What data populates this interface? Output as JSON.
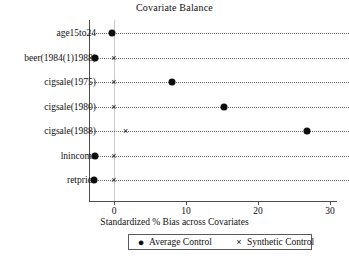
{
  "chart_data": {
    "type": "scatter",
    "title": "Covariate Balance",
    "xlabel": "Standardized % Bias across Covariates",
    "ylabel": "",
    "xlim": [
      -3.5,
      31
    ],
    "xticks": [
      0,
      10,
      20,
      30
    ],
    "xticklabels": [
      "0",
      "10",
      "20",
      "30"
    ],
    "grid": "horizontal-dotted-rows",
    "zero_reference_line": 0,
    "legend_position": "below-axis",
    "categories": [
      "age15to24",
      "beer(1984(1)1988)",
      "cigsale(1975)",
      "cigsale(1980)",
      "cigsale(1988)",
      "lnincome",
      "retprice"
    ],
    "series": [
      {
        "name": "Average Control",
        "marker": "filled-circle",
        "color": "#0d0d0d",
        "values": [
          -0.3,
          -2.6,
          8.1,
          15.3,
          26.8,
          -2.7,
          -2.8
        ]
      },
      {
        "name": "Synthetic Control",
        "marker": "cross-x",
        "color": "#0d0d0d",
        "values": [
          -0.3,
          0.0,
          0.0,
          0.0,
          1.6,
          0.0,
          0.0
        ]
      }
    ]
  },
  "legend": {
    "entries": [
      {
        "label": "Average Control",
        "glyph": "●",
        "icon_name": "filled-circle-marker-icon"
      },
      {
        "label": "Synthetic Control",
        "glyph": "×",
        "icon_name": "cross-marker-icon"
      }
    ]
  }
}
